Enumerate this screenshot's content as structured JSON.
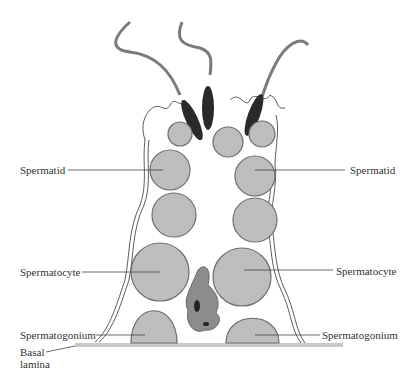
{
  "diagram": {
    "labels": {
      "spermatid_left": "Spermatid",
      "spermatid_right": "Spermatid",
      "spermatocyte_left": "Spermatocyte",
      "spermatocyte_right": "Spermatocyte",
      "spermatogonium_left": "Spermatogonium",
      "spermatogonium_right": "Spermatogonium",
      "basal_lamina_line1": "Basal",
      "basal_lamina_line2": "lamina"
    },
    "colors": {
      "cell_fill": "#bdbdbd",
      "cell_stroke": "#6e6e6e",
      "sperm_head": "#2a2a2a",
      "flagellum": "#7a7a7a",
      "sertoli": "#8c8c8c",
      "basal_lamina": "#c8c8c8"
    }
  }
}
